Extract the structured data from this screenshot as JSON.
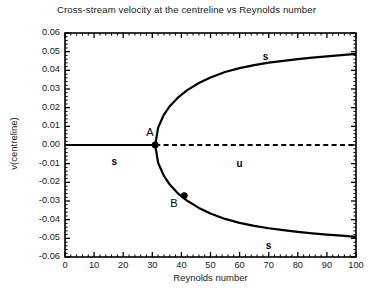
{
  "chart_data": {
    "type": "line",
    "title": "Cross-stream velocity at the centreline vs Reynolds number",
    "xlabel": "Reynolds number",
    "ylabel": "v(centreline)",
    "xlim": [
      0,
      100
    ],
    "ylim": [
      -0.06,
      0.06
    ],
    "grid": false,
    "legend": "none",
    "xticks": [
      "0",
      "10",
      "20",
      "30",
      "40",
      "50",
      "60",
      "70",
      "80",
      "90",
      "100"
    ],
    "xtick_values": [
      0,
      10,
      20,
      30,
      40,
      50,
      60,
      70,
      80,
      90,
      100
    ],
    "yticks": [
      "0.06",
      "0.05",
      "0.04",
      "0.03",
      "0.02",
      "0.01",
      "0.00",
      "-0.01",
      "-0.02",
      "-0.03",
      "-0.04",
      "-0.05",
      "-0.06"
    ],
    "ytick_values": [
      0.06,
      0.05,
      0.04,
      0.03,
      0.02,
      0.01,
      0.0,
      -0.01,
      -0.02,
      -0.03,
      -0.04,
      -0.05,
      -0.06
    ],
    "minor_tick_interval_x": 2,
    "minor_tick_interval_y": 0.002,
    "bifurcation_reynolds": 31,
    "series": [
      {
        "name": "stable-trivial-branch",
        "style": "solid",
        "stability": "s",
        "x": [
          0,
          5,
          10,
          15,
          20,
          25,
          31
        ],
        "values": [
          0.0,
          0.0,
          0.0,
          0.0,
          0.0,
          0.0,
          0.0
        ]
      },
      {
        "name": "unstable-trivial-branch",
        "style": "dashed",
        "stability": "u",
        "x": [
          31,
          40,
          50,
          60,
          70,
          80,
          90,
          100
        ],
        "values": [
          0.0,
          0.0,
          0.0,
          0.0,
          0.0,
          0.0,
          0.0,
          0.0
        ]
      },
      {
        "name": "upper-stable-branch",
        "style": "solid",
        "stability": "s",
        "x": [
          31,
          32,
          34,
          36,
          39,
          42,
          46,
          50,
          55,
          60,
          65,
          70,
          75,
          80,
          85,
          90,
          95,
          100
        ],
        "values": [
          0.0,
          0.0093,
          0.0163,
          0.0208,
          0.0257,
          0.0294,
          0.0332,
          0.0362,
          0.0391,
          0.0412,
          0.0428,
          0.0441,
          0.0451,
          0.046,
          0.0468,
          0.0475,
          0.0482,
          0.0488
        ]
      },
      {
        "name": "lower-stable-branch",
        "style": "solid",
        "stability": "s",
        "x": [
          31,
          32,
          34,
          36,
          39,
          42,
          46,
          50,
          55,
          60,
          65,
          70,
          75,
          80,
          85,
          90,
          95,
          100
        ],
        "values": [
          0.0,
          -0.0095,
          -0.0166,
          -0.0212,
          -0.0262,
          -0.0299,
          -0.0337,
          -0.0367,
          -0.0396,
          -0.0417,
          -0.0433,
          -0.0446,
          -0.0456,
          -0.0465,
          -0.0473,
          -0.048,
          -0.0486,
          -0.0492
        ]
      }
    ],
    "annotations": [
      {
        "text": "A",
        "x": 31,
        "y": 0.0,
        "role": "bifurcation-point-label"
      },
      {
        "text": "B",
        "x": 41,
        "y": -0.027,
        "role": "lower-branch-point-label"
      },
      {
        "text": "s",
        "x": 17,
        "y": -0.009,
        "role": "stability-label"
      },
      {
        "text": "s",
        "x": 69,
        "y": 0.047,
        "role": "stability-label"
      },
      {
        "text": "s",
        "x": 70,
        "y": -0.054,
        "role": "stability-label"
      },
      {
        "text": "u",
        "x": 60,
        "y": -0.01,
        "role": "stability-label"
      }
    ],
    "markers": [
      {
        "name": "point-A",
        "x": 31,
        "y": 0.0
      },
      {
        "name": "point-B",
        "x": 41,
        "y": -0.0271
      }
    ],
    "colors": {
      "axis": "#000000",
      "curve": "#000000",
      "text": "#1a1a1a",
      "background": "#ffffff"
    }
  }
}
